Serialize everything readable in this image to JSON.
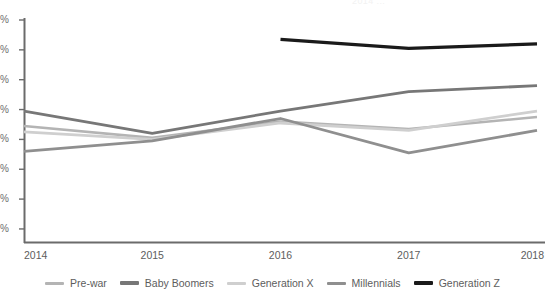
{
  "figure": {
    "clipped_title_fragment": "2014 ...",
    "background": "#ffffff"
  },
  "axes": {
    "x_tick_labels": [
      "2014",
      "2015",
      "2016",
      "2017",
      "2018"
    ],
    "y_tick_labels": [
      "%",
      "%",
      "%",
      "%",
      "%",
      "%",
      "%",
      "%"
    ],
    "y_axis_note": "numeric portion of y tick labels is cropped off the left edge of the screenshot",
    "axis_color": "#6b6b6b"
  },
  "legend": {
    "items": [
      {
        "label": "Pre-war",
        "color": "#b4b4b4"
      },
      {
        "label": "Baby Boomers",
        "color": "#777777"
      },
      {
        "label": "Generation X",
        "color": "#cfcfcf"
      },
      {
        "label": "Millennials",
        "color": "#8f8f8f"
      },
      {
        "label": "Generation Z",
        "color": "#1a1a1a"
      }
    ]
  },
  "chart_data": {
    "type": "line",
    "title": "",
    "xlabel": "",
    "ylabel": "%",
    "x": [
      "2014",
      "2015",
      "2016",
      "2017",
      "2018"
    ],
    "ylim": [
      10,
      80
    ],
    "ytick_values": [
      80,
      70,
      60,
      50,
      40,
      30,
      20,
      10
    ],
    "grid": false,
    "legend_position": "bottom",
    "series": [
      {
        "name": "Pre-war",
        "color": "#b4b4b4",
        "width": 2.6,
        "values": [
          44.5,
          40.5,
          46.0,
          43.5,
          47.5
        ]
      },
      {
        "name": "Baby Boomers",
        "color": "#777777",
        "width": 2.8,
        "values": [
          49.5,
          42.0,
          49.5,
          56.0,
          58.0
        ]
      },
      {
        "name": "Generation X",
        "color": "#cfcfcf",
        "width": 2.8,
        "values": [
          42.5,
          40.0,
          45.5,
          43.0,
          49.5
        ]
      },
      {
        "name": "Millennials",
        "color": "#8f8f8f",
        "width": 2.8,
        "values": [
          36.0,
          39.5,
          47.0,
          35.5,
          43.0
        ]
      },
      {
        "name": "Generation Z",
        "color": "#1a1a1a",
        "width": 3.2,
        "values": [
          null,
          null,
          73.5,
          70.5,
          72.0
        ]
      }
    ]
  }
}
